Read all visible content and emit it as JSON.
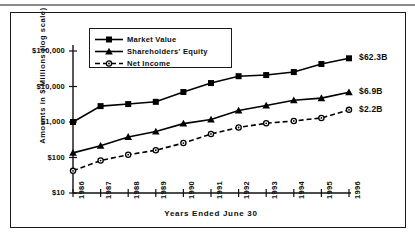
{
  "figure": {
    "frame_border_color": "#1a1a1a",
    "background": "#ffffff",
    "series_color": "#000000"
  },
  "chart_data": {
    "type": "line",
    "title": "",
    "subtitle": "",
    "xlabel": "Years Ended June 30",
    "ylabel": "Amounts in $ Millions (log scale)",
    "yscale": "log",
    "ylim": [
      10,
      100000
    ],
    "grid": false,
    "legend_position": "top-left-inside",
    "ytick_labels": [
      "$100,000",
      "$10,000",
      "$1,000",
      "$100",
      "$10"
    ],
    "ytick_values": [
      100000,
      10000,
      1000,
      100,
      10
    ],
    "categories": [
      "1986",
      "1987",
      "1988",
      "1989",
      "1990",
      "1991",
      "1992",
      "1993",
      "1994",
      "1995",
      "1996"
    ],
    "series": [
      {
        "name": "Market Value",
        "marker": "square",
        "linestyle": "solid",
        "values": [
          1000,
          2800,
          3200,
          3700,
          7000,
          12500,
          19500,
          21000,
          25500,
          43000,
          62300
        ]
      },
      {
        "name": "Shareholders' Equity",
        "marker": "triangle",
        "linestyle": "solid",
        "values": [
          135,
          215,
          380,
          540,
          900,
          1180,
          2100,
          2900,
          4100,
          4700,
          6900
        ]
      },
      {
        "name": "Net Income",
        "marker": "circle",
        "linestyle": "dashed",
        "values": [
          42,
          82,
          120,
          160,
          255,
          460,
          700,
          920,
          1070,
          1300,
          2200
        ]
      }
    ],
    "annotations": [
      {
        "text": "$62.3B",
        "series": "Market Value",
        "at_category": "1996"
      },
      {
        "text": "$6.9B",
        "series": "Shareholders' Equity",
        "at_category": "1996"
      },
      {
        "text": "$2.2B",
        "series": "Net Income",
        "at_category": "1996"
      }
    ]
  }
}
